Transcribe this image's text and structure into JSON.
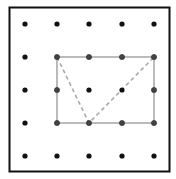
{
  "diagram": {
    "type": "geoboard",
    "grid": {
      "rows": 5,
      "cols": 5
    },
    "frame": {
      "x": 9.5,
      "y": 7.5,
      "width": 160,
      "height": 164,
      "stroke": "#111111",
      "stroke_width": 2
    },
    "grid_x": [
      25,
      57,
      89,
      122,
      154
    ],
    "grid_y": [
      24,
      57,
      90,
      123,
      156
    ],
    "dot_color": "#111111",
    "dot_radius": 2.6,
    "rectangle": {
      "from": [
        1,
        1
      ],
      "to": [
        4,
        3
      ],
      "stroke": "#aaaaaa",
      "stroke_width": 1.6
    },
    "triangle": {
      "vertices": [
        [
          1,
          1
        ],
        [
          2,
          3
        ],
        [
          4,
          1
        ]
      ],
      "stroke": "#aaaaaa",
      "stroke_width": 1.6,
      "dash": "4,3"
    }
  }
}
